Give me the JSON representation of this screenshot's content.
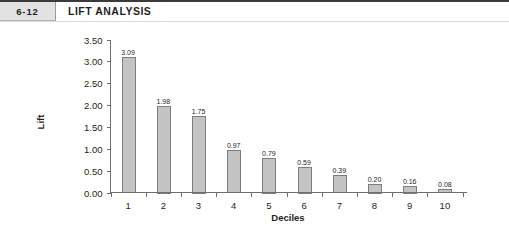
{
  "header": {
    "chapter_number": "6-12",
    "title": "LIFT ANALYSIS"
  },
  "chart_data": {
    "type": "bar",
    "title": "LIFT ANALYSIS",
    "categories": [
      "1",
      "2",
      "3",
      "4",
      "5",
      "6",
      "7",
      "8",
      "9",
      "10"
    ],
    "values": [
      3.09,
      1.98,
      1.75,
      0.97,
      0.79,
      0.59,
      0.39,
      0.2,
      0.16,
      0.08
    ],
    "value_labels": [
      "3.09",
      "1.98",
      "1.75",
      "0.97",
      "0.79",
      "0.59",
      "0.39",
      "0.20",
      "0.16",
      "0.08"
    ],
    "xlabel": "Deciles",
    "ylabel": "Lift",
    "ylim": [
      0,
      3.5
    ],
    "ytick_values": [
      0,
      0.5,
      1.0,
      1.5,
      2.0,
      2.5,
      3.0,
      3.5
    ],
    "ytick_labels": [
      "0.00",
      "0.50",
      "1.00",
      "1.50",
      "2.00",
      "2.50",
      "3.00",
      "3.50"
    ],
    "grid": false,
    "legend": false,
    "bar_fill_color": "#c4c4c4",
    "bar_edge_color": "#7d7d7d",
    "axis_color": "#6e6e6e",
    "background_color": "#ffffff"
  }
}
